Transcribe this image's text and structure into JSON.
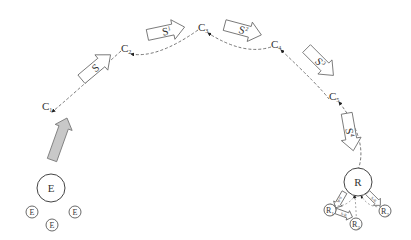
{
  "diagram": {
    "title": "",
    "colors": {
      "line": "#555555",
      "gray_arrow_fill": "#c8c8c8",
      "gray_arrow_stroke": "#777777",
      "background": "#ffffff"
    },
    "path_nodes": [
      {
        "id": "C1",
        "base": "C",
        "sub": "1",
        "x": 42,
        "y": 107
      },
      {
        "id": "C2",
        "base": "C",
        "sub": "2",
        "x": 121,
        "y": 49
      },
      {
        "id": "C3",
        "base": "C",
        "sub": "3",
        "x": 198,
        "y": 28
      },
      {
        "id": "C4",
        "base": "C",
        "sub": "4",
        "x": 271,
        "y": 45
      },
      {
        "id": "C5",
        "base": "C",
        "sub": "5",
        "x": 329,
        "y": 97
      }
    ],
    "edges": [
      {
        "from": "C2",
        "to": "C1",
        "style": "dashed"
      },
      {
        "from": "C3",
        "to": "C2",
        "style": "dashed"
      },
      {
        "from": "C4",
        "to": "C3",
        "style": "dashed"
      },
      {
        "from": "C5",
        "to": "C4",
        "style": "dashed"
      },
      {
        "from": "R",
        "to": "C5",
        "style": "dashed"
      }
    ],
    "step_arrows": [
      {
        "label": "S",
        "sup": "",
        "cx": 96,
        "cy": 67,
        "angle": -40
      },
      {
        "label": "S",
        "sup": "1",
        "cx": 166,
        "cy": 31,
        "angle": -12
      },
      {
        "label": "S",
        "sup": "2",
        "cx": 243,
        "cy": 30,
        "angle": 15
      },
      {
        "label": "S",
        "sup": "3",
        "cx": 320,
        "cy": 62,
        "angle": 45
      },
      {
        "label": "S",
        "sup": "4",
        "cx": 350,
        "cy": 132,
        "angle": 80
      }
    ],
    "entry_arrow": {
      "from": [
        52,
        160
      ],
      "to": [
        67,
        118
      ],
      "fill": "#c8c8c8"
    },
    "source_group": {
      "main": {
        "label": "E",
        "cx": 51,
        "cy": 188,
        "r": 14
      },
      "members": [
        {
          "label": "E",
          "cx": 32,
          "cy": 212,
          "r": 6
        },
        {
          "label": "E",
          "cx": 52,
          "cy": 225,
          "r": 6
        },
        {
          "label": "E",
          "cx": 75,
          "cy": 212,
          "r": 6
        }
      ]
    },
    "target_group": {
      "main": {
        "label": "R",
        "cx": 358,
        "cy": 182,
        "r": 14
      },
      "members": [
        {
          "label": "R",
          "sub": "1",
          "cx": 330,
          "cy": 210,
          "r": 6
        },
        {
          "label": "R",
          "sub": "2",
          "cx": 356,
          "cy": 224,
          "r": 6
        },
        {
          "label": "R",
          "sub": "3",
          "cx": 385,
          "cy": 211,
          "r": 6
        }
      ],
      "small_arrows": [
        {
          "label": "S-R",
          "cx": 340,
          "cy": 200,
          "angle": 120
        },
        {
          "label": "S-R",
          "cx": 344,
          "cy": 214,
          "angle": 20
        },
        {
          "label": "S-R",
          "cx": 374,
          "cy": 199,
          "angle": 45
        }
      ]
    }
  }
}
